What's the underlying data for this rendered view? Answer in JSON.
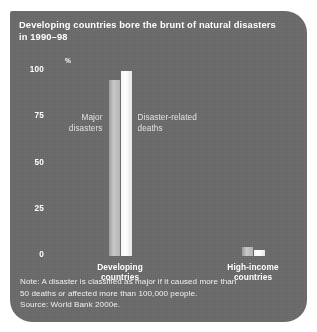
{
  "figure": {
    "title": "Developing countries bore the brunt of natural disasters\nin 1990–98",
    "panel_color": "#6b6b6b",
    "title_color": "#ffffff"
  },
  "axis": {
    "unit_label": "%",
    "ticks": [
      {
        "value": 100,
        "label": "100"
      },
      {
        "value": 75,
        "label": "75"
      },
      {
        "value": 50,
        "label": "50"
      },
      {
        "value": 25,
        "label": "25"
      },
      {
        "value": 0,
        "label": "0"
      }
    ]
  },
  "annotations": {
    "major": "Major\ndisasters",
    "deaths": "Disaster-related\ndeaths"
  },
  "categories": [
    {
      "label": "Developing\ncountries"
    },
    {
      "label": "High-income\ncountries"
    }
  ],
  "footnote": {
    "note": "Note: A disaster is classified as major if it caused more than\n50 deaths or affected more than 100,000 people.",
    "source": "Source: World Bank 2000e."
  },
  "chart_data": {
    "type": "bar",
    "title": "Developing countries bore the brunt of natural disasters in 1990–98",
    "xlabel": "",
    "ylabel": "%",
    "ylim": [
      0,
      100
    ],
    "yticks": [
      0,
      25,
      50,
      75,
      100
    ],
    "grid": false,
    "legend_position": "inline-annotations",
    "categories": [
      "Developing countries",
      "High-income countries"
    ],
    "series": [
      {
        "name": "Major disasters",
        "color": "#c9c9c9",
        "values": [
          95,
          5
        ]
      },
      {
        "name": "Disaster-related deaths",
        "color": "#ffffff",
        "values": [
          100,
          3
        ]
      }
    ],
    "annotations": [
      "Note: A disaster is classified as major if it caused more than 50 deaths or affected more than 100,000 people.",
      "Source: World Bank 2000e."
    ]
  }
}
